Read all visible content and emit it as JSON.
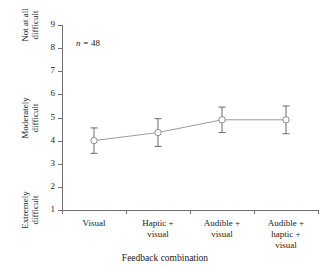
{
  "chart_data": {
    "type": "line",
    "title": "",
    "subtitle": "",
    "xlabel": "Feedback combination",
    "ylabel": "",
    "categories": [
      "Visual",
      "Haptic + visual",
      "Audible + visual",
      "Audible + haptic + visual"
    ],
    "category_lines": [
      [
        "Visual"
      ],
      [
        "Haptic +",
        "visual"
      ],
      [
        "Audible +",
        "visual"
      ],
      [
        "Audible +",
        "haptic +",
        "visual"
      ]
    ],
    "series": [
      {
        "name": "Perceived difficulty",
        "values": [
          4.0,
          4.35,
          4.9,
          4.9
        ],
        "error_upper": [
          0.55,
          0.6,
          0.55,
          0.6
        ],
        "error_lower": [
          0.55,
          0.6,
          0.55,
          0.6
        ]
      }
    ],
    "ylim": [
      1,
      9
    ],
    "yticks": [
      1,
      2,
      3,
      4,
      5,
      6,
      7,
      8,
      9
    ],
    "ytick_labels": [
      "1",
      "2",
      "3",
      "4",
      "5",
      "6",
      "7",
      "8",
      "9"
    ],
    "y_anchor_labels": [
      {
        "value": 9,
        "line1": "Not at all",
        "line2": "difficult"
      },
      {
        "value": 5,
        "line1": "Moderately",
        "line2": "difficult"
      },
      {
        "value": 1,
        "line1": "Extremely",
        "line2": "difficult"
      }
    ],
    "annotations": [
      {
        "italic_symbol": "n",
        "text": " = 48"
      }
    ],
    "grid": false,
    "legend": "none",
    "marker": "open-circle",
    "colors": {
      "line": "#9a9a9a",
      "marker_edge": "#8c8c8c",
      "marker_fill": "#ffffff",
      "error_bar": "#6b6b6b",
      "axis": "#6f6f6f",
      "text": "#1a1a1a",
      "background": "#ffffff"
    }
  },
  "annotation": {
    "n_symbol": "n",
    "n_value": " = 48"
  },
  "axis": {
    "x_title": "Feedback combination"
  }
}
